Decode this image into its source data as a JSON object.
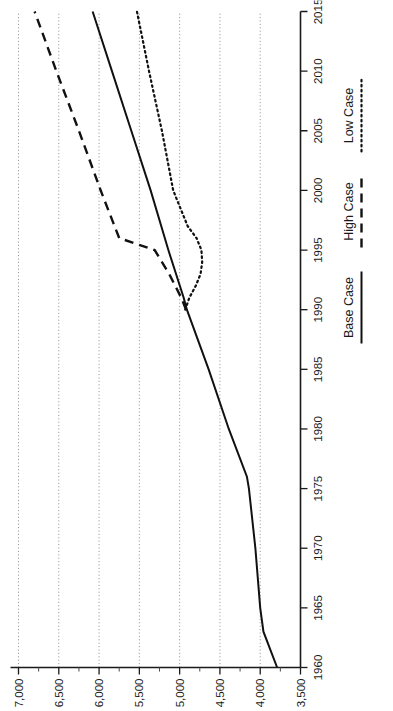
{
  "figure": {
    "orientation": "rotated-90-ccw",
    "background": "#ffffff",
    "ink_color": "#111111",
    "grid_color": "#8d8d8d"
  },
  "legend": {
    "position": "below-x-axis-right",
    "items": [
      {
        "label": "Base Case",
        "style": "solid",
        "name": "legend-base-case"
      },
      {
        "label": "High Case",
        "style": "dashed",
        "name": "legend-high-case"
      },
      {
        "label": "Low Case",
        "style": "dotted",
        "name": "legend-low-case"
      }
    ]
  },
  "axes": {
    "x": {
      "label": "",
      "min": 1960,
      "max": 2015,
      "tick_step": 5,
      "ticks": [
        1960,
        1965,
        1970,
        1975,
        1980,
        1985,
        1990,
        1995,
        2000,
        2005,
        2010,
        2015
      ],
      "tick_labels": [
        "1960",
        "1965",
        "1970",
        "1975",
        "1980",
        "1985",
        "1990",
        "1995",
        "2000",
        "2005",
        "2010",
        "2015"
      ]
    },
    "y": {
      "label": "",
      "min": 3500,
      "max": 7000,
      "tick_step": 500,
      "minor_step": 250,
      "ticks": [
        3500,
        4000,
        4500,
        5000,
        5500,
        6000,
        6500,
        7000
      ],
      "tick_labels": [
        "3,500",
        "4,000",
        "4,500",
        "5,000",
        "5,500",
        "6,000",
        "6,500",
        "7,000"
      ],
      "minor_ticks": [
        3750,
        4250,
        4750,
        5250,
        5750,
        6250,
        6750
      ],
      "gridlines_at": [
        4000,
        4500,
        5000,
        5500,
        6000,
        6500,
        7000
      ]
    },
    "grid": "vertical-dotted-on-y-values"
  },
  "chart_data": {
    "type": "line",
    "title": "",
    "subtitle": "",
    "xlabel": "",
    "ylabel": "",
    "xlim": [
      1960,
      2015
    ],
    "ylim": [
      3500,
      7000
    ],
    "grid": true,
    "legend_position": "bottom-right",
    "series": [
      {
        "name": "Base Case",
        "style": "solid",
        "x": [
          1960,
          1963,
          1965,
          1970,
          1975,
          1976,
          1980,
          1985,
          1990,
          1991,
          1995,
          2000,
          2005,
          2010,
          2015
        ],
        "values": [
          3790,
          3960,
          4000,
          4060,
          4140,
          4165,
          4390,
          4640,
          4910,
          4950,
          5140,
          5360,
          5600,
          5840,
          6080
        ]
      },
      {
        "name": "High Case",
        "style": "dashed",
        "x": [
          1990,
          1991,
          1993,
          1995,
          1996,
          2000,
          2005,
          2010,
          2015
        ],
        "values": [
          4920,
          4980,
          5130,
          5310,
          5750,
          5980,
          6250,
          6530,
          6800
        ]
      },
      {
        "name": "Low Case",
        "style": "dotted",
        "x": [
          1990,
          1991,
          1992,
          1993,
          1994,
          1995,
          1996,
          1997,
          2000,
          2005,
          2010,
          2015
        ],
        "values": [
          4930,
          4880,
          4800,
          4740,
          4720,
          4730,
          4790,
          4900,
          5080,
          5220,
          5380,
          5530
        ]
      }
    ]
  }
}
